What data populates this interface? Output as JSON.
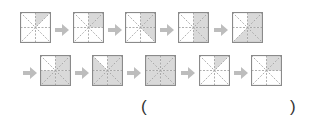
{
  "colors": {
    "border": "#8a8a8a",
    "guide": "#9a9a9a",
    "shade": "#d9d9d9",
    "arrow": "#bdbdbd",
    "text": "#333333"
  },
  "triangle_order": [
    "top-right",
    "right-upper",
    "right-lower",
    "bottom-right",
    "bottom-left",
    "left-lower",
    "left-upper",
    "top-left"
  ],
  "rows": [
    {
      "squares": [
        {
          "shaded_count": 1
        },
        {
          "shaded_count": 2
        },
        {
          "shaded_count": 3
        },
        {
          "shaded_count": 4
        },
        {
          "shaded_count": 5
        }
      ],
      "leading_arrow": false
    },
    {
      "squares": [
        {
          "shaded_count": 6
        },
        {
          "shaded_count": 7
        },
        {
          "shaded_count": 8
        },
        {
          "shaded_count": 1
        },
        {
          "shaded_count": 2
        }
      ],
      "leading_arrow": true
    }
  ],
  "answer": {
    "open_paren": "(",
    "close_paren": ")",
    "value": ""
  }
}
